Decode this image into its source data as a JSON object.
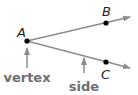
{
  "diagram": {
    "points": [
      {
        "id": "A",
        "label": "A",
        "x": 27,
        "y": 41,
        "label_x": 17,
        "label_y": 37
      },
      {
        "id": "B",
        "label": "B",
        "x": 106,
        "y": 23,
        "label_x": 102,
        "label_y": 16
      },
      {
        "id": "C",
        "label": "C",
        "x": 106,
        "y": 62,
        "label_x": 101,
        "label_y": 79
      }
    ],
    "rays": [
      {
        "from": "A",
        "through": "B",
        "end_x": 130,
        "end_y": 17
      },
      {
        "from": "A",
        "through": "C",
        "end_x": 130,
        "end_y": 68
      }
    ],
    "annotations": [
      {
        "id": "vertex",
        "label": "vertex",
        "arrow_from": [
          27,
          68
        ],
        "arrow_to": [
          27,
          47
        ],
        "label_x": 27,
        "label_y": 82
      },
      {
        "id": "side",
        "label": "side",
        "arrow_from": [
          84,
          73
        ],
        "arrow_to": [
          84,
          58
        ],
        "label_x": 84,
        "label_y": 91
      }
    ],
    "colors": {
      "ray": "#8a8c8e",
      "point": "#000000",
      "point_label": "#231f20",
      "term_label": "#6d6e71",
      "annotation_arrow": "#8a8c8e"
    }
  }
}
